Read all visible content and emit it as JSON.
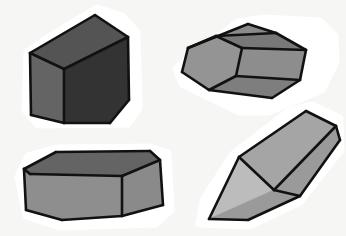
{
  "scene": {
    "title": "Four shaded 3D geometric solids on white background",
    "width": 346,
    "height": 236,
    "background_color": "#f6f6f4",
    "outline_color": "#111111",
    "halo_color": "#ffffff",
    "style": "hand-drawn sticker-cut shaded polyhedra, grayscale"
  },
  "objects": [
    {
      "id": "cube-top-left",
      "name": "Dark grey cube",
      "shape_type": "cube",
      "position": "top-left",
      "halo_points": "44,40 97,8 122,16 137,32 139,108 128,124 38,125 25,110 27,52",
      "faces": [
        {
          "name": "top-face",
          "fill": "#545454",
          "points": "30,53 95,15 128,37 64,69"
        },
        {
          "name": "front-left-face",
          "fill": "#646464",
          "points": "30,53 64,69 64,123 31,115"
        },
        {
          "name": "right-face",
          "fill": "#333333",
          "points": "64,69 128,37 129,100 110,123 64,123"
        }
      ],
      "edges": [
        "30,53 95,15",
        "95,15 128,37",
        "128,37 129,100",
        "129,100 110,123",
        "110,123 64,123",
        "64,123 31,115",
        "31,115 30,53",
        "30,53 64,69",
        "64,69 128,37",
        "64,69 64,123"
      ],
      "fill_color_light": "#646464",
      "fill_color_mid": "#545454",
      "fill_color_dark": "#333333"
    },
    {
      "id": "hex-prism-top-right",
      "name": "Hexagonal prism",
      "shape_type": "hexagonal-prism",
      "position": "top-right",
      "halo_points": "176,68 238,22 264,18 320,21 335,36 336,62 322,90 268,112 240,112 182,84",
      "faces": [
        {
          "name": "hex-end-face",
          "fill": "#949494",
          "points": "182,72 188,48 216,36 242,48 236,76 209,90"
        },
        {
          "name": "prism-top-face-upper",
          "fill": "#8a8a8a",
          "points": "188,48 248,24 276,33 216,36"
        },
        {
          "name": "prism-top-face-ridge",
          "fill": "#787878",
          "points": "216,36 276,33 306,50 242,48"
        },
        {
          "name": "prism-side-face",
          "fill": "#8d8d8d",
          "points": "242,48 306,50 300,80 236,76"
        },
        {
          "name": "prism-lower-face",
          "fill": "#7e7e7e",
          "points": "236,76 300,80 272,98 209,90"
        }
      ],
      "edges": [
        "182,72 188,48",
        "188,48 248,24",
        "248,24 276,33",
        "276,33 306,50",
        "306,50 300,80",
        "300,80 272,98",
        "272,98 209,90",
        "209,90 182,72",
        "188,48 216,36",
        "216,36 242,48",
        "242,48 236,76",
        "236,76 209,90",
        "216,36 276,33",
        "242,48 306,50",
        "236,76 300,80"
      ],
      "fill_color_light": "#949494",
      "fill_color_mid": "#8a8a8a",
      "fill_color_dark": "#787878"
    },
    {
      "id": "box-bottom-left",
      "name": "Flat rectangular box",
      "shape_type": "cuboid",
      "position": "bottom-left",
      "halo_points": "18,177 28,156 58,148 150,147 168,153 171,210 156,224 60,227 26,216",
      "faces": [
        {
          "name": "box-top-face",
          "fill": "#646464",
          "points": "24,169 56,152 150,151 160,160 122,176 30,174"
        },
        {
          "name": "box-front-face",
          "fill": "#8e8e8e",
          "points": "24,169 30,174 122,176 122,216 62,220 26,210"
        },
        {
          "name": "box-right-face",
          "fill": "#8a8a8a",
          "points": "122,176 160,160 163,205 122,216"
        }
      ],
      "edges": [
        "24,169 56,152",
        "56,152 150,151",
        "150,151 160,160",
        "160,160 163,205",
        "163,205 122,216",
        "122,216 62,220",
        "62,220 26,210",
        "26,210 24,169",
        "24,169 30,174",
        "30,174 122,176",
        "122,176 160,160",
        "122,176 122,216"
      ],
      "fill_color_light": "#8e8e8e",
      "fill_color_mid": "#8a8a8a",
      "fill_color_dark": "#646464"
    },
    {
      "id": "wedge-bottom-right",
      "name": "Triangular prism wedge",
      "shape_type": "triangular-prism",
      "position": "bottom-right",
      "halo_points": "199,224 203,200 233,154 289,111 312,105 340,118 341,150 300,202 250,226",
      "faces": [
        {
          "name": "wedge-top-face",
          "fill": "#a5a5a5",
          "points": "239,157 306,111 336,126 274,190"
        },
        {
          "name": "wedge-front-triangle-face",
          "fill": "#bcbcbc",
          "points": "239,157 274,190 209,219"
        },
        {
          "name": "wedge-bottom-face",
          "fill": "#9a9a9a",
          "points": "209,219 274,190 336,126 340,140 300,196 248,220"
        }
      ],
      "edges": [
        "239,157 306,111",
        "306,111 336,126",
        "336,126 340,140",
        "340,140 300,196",
        "300,196 248,220",
        "248,220 209,219",
        "209,219 239,157",
        "239,157 274,190",
        "274,190 336,126",
        "274,190 300,196"
      ],
      "fill_color_light": "#bcbcbc",
      "fill_color_mid": "#a5a5a5",
      "fill_color_dark": "#9a9a9a"
    }
  ]
}
